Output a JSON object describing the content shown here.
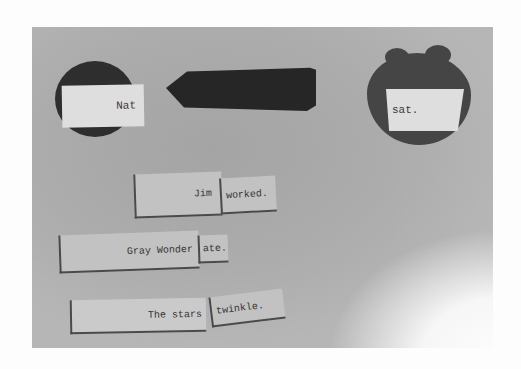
{
  "photo": {
    "description": "Photograph of sentence-diagram word cards on a gray background",
    "background_color": "#adadad",
    "shape_color": "#2e2e2e",
    "card_color": "#dedede"
  },
  "top_diagram": {
    "subject": "Nat",
    "predicate": "sat.",
    "connector": "arrow pointing left"
  },
  "sentences": [
    {
      "subject": "Jim",
      "predicate": "worked."
    },
    {
      "subject": "Gray Wonder",
      "predicate": "ate."
    },
    {
      "subject": "The stars",
      "predicate": "twinkle."
    }
  ]
}
